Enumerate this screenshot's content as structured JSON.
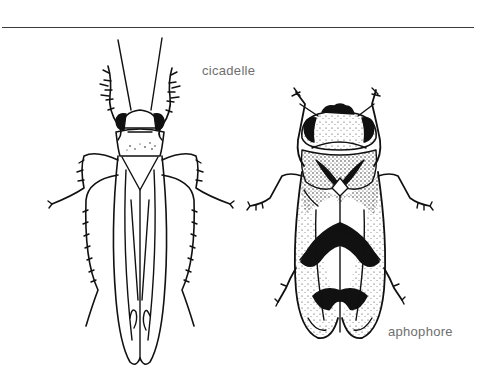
{
  "figure": {
    "labels": {
      "cicadelle": "cicadelle",
      "aphophore": "aphophore"
    },
    "insects": [
      {
        "name": "cicadelle",
        "style": "line-drawing"
      },
      {
        "name": "aphophore",
        "style": "stippled-drawing"
      }
    ],
    "colors": {
      "ink": "#111111",
      "label": "#6e6e6e",
      "rule": "#3a3a3a",
      "background": "#ffffff"
    }
  }
}
